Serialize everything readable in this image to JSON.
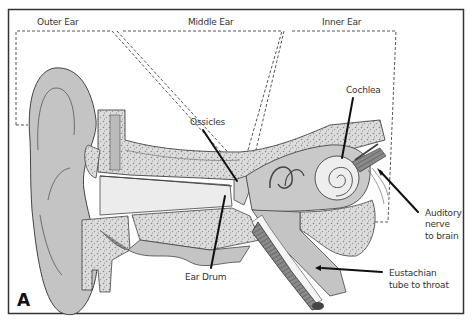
{
  "diagram": {
    "panel_letter": "A",
    "region_labels": {
      "outer": "Outer Ear",
      "middle": "Middle Ear",
      "inner": "Inner Ear"
    },
    "callouts": {
      "ossicles": "Ossicles",
      "cochlea": "Cochlea",
      "ear_drum": "Ear Drum",
      "auditory_nerve": [
        "Auditory",
        "nerve",
        "to brain"
      ],
      "eustachian_tube": [
        "Eustachian",
        "tube to throat"
      ]
    },
    "colors": {
      "tissue": "#c4c4c4",
      "tissue_dark": "#a8a8a8",
      "bone": "#d9d9d9",
      "outline": "#444444",
      "border": "#333333",
      "leader": "#111111",
      "ossicle_accent": "#555555"
    }
  }
}
